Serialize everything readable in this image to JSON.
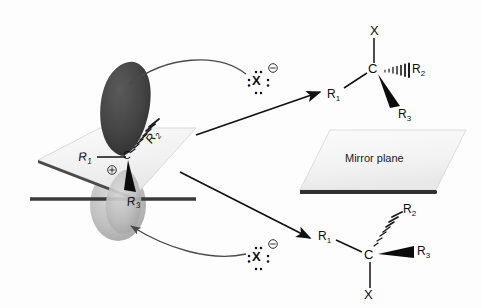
{
  "diagram": {
    "mirror_plane_label": "Mirror plane",
    "colors": {
      "background": "#fdfdfd",
      "plane_fill": "#f2f2f2",
      "plane_edge_dark": "#3a3a3a",
      "orbital_top": "#3d3d3d",
      "orbital_bottom": "#a9a9a9",
      "bond": "#111111",
      "arrow": "#4a4a4a",
      "text": "#0d0d0d"
    }
  },
  "carbocation": {
    "center_atom": "C",
    "charge": "⊕",
    "substituents": {
      "r1": "R",
      "r1_sub": "1",
      "r2": "R",
      "r2_sub": "2",
      "r3": "R",
      "r3_sub": "3"
    }
  },
  "nucleophiles": [
    {
      "symbol": "X",
      "charge": "⊖",
      "position": "top"
    },
    {
      "symbol": "X",
      "charge": "⊖",
      "position": "bottom"
    }
  ],
  "products": {
    "top": {
      "center_atom": "C",
      "up_group": "X",
      "left_group": "R",
      "left_sub": "1",
      "hash_group": "R",
      "hash_sub": "2",
      "wedge_group": "R",
      "wedge_sub": "3"
    },
    "bottom": {
      "center_atom": "C",
      "down_group": "X",
      "left_group": "R",
      "left_sub": "1",
      "hash_group": "R",
      "hash_sub": "2",
      "wedge_group": "R",
      "wedge_sub": "3"
    }
  }
}
